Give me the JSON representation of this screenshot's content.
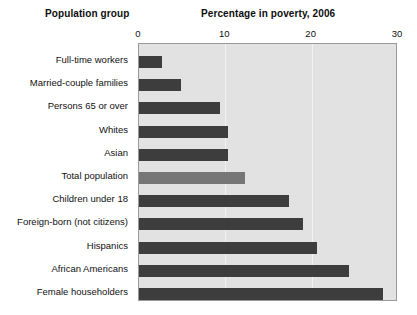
{
  "headings": {
    "left": "Population group",
    "right": "Percentage in poverty, 2006"
  },
  "chart_data": {
    "type": "bar",
    "orientation": "horizontal",
    "title": "Percentage in poverty, 2006",
    "xlabel": "Percentage in poverty, 2006",
    "ylabel": "Population group",
    "xlim": [
      0,
      30
    ],
    "ticks": [
      "0",
      "10",
      "20",
      "30"
    ],
    "tick_values": [
      0,
      10,
      20,
      30
    ],
    "grid": true,
    "legend": "none",
    "colors": {
      "bar": "#3d3d3d",
      "highlight_bar": "#767676",
      "plot_background": "#e2e2e2",
      "gridline": "#f2f2f2",
      "border": "#9a9a9a"
    },
    "categories": [
      "Full-time workers",
      "Married-couple families",
      "Persons 65 or over",
      "Whites",
      "Asian",
      "Total population",
      "Children under 18",
      "Foreign-born (not citizens)",
      "Hispanics",
      "African Americans",
      "Female householders"
    ],
    "values": [
      2.7,
      4.9,
      9.4,
      10.3,
      10.3,
      12.3,
      17.4,
      19.0,
      20.6,
      24.3,
      28.3
    ],
    "highlight_index": 5
  }
}
